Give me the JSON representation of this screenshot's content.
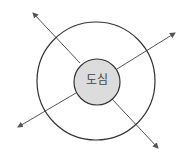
{
  "diagram": {
    "center_label": "도심",
    "colors": {
      "line": "#333333",
      "arrow": "#555555",
      "center_fill": "#dcdcdc",
      "background": "#ffffff"
    },
    "outer_circle": {
      "cx": 96,
      "cy": 81,
      "r": 59
    },
    "inner_circle": {
      "cx": 97,
      "cy": 82,
      "r": 23
    },
    "arrows": [
      {
        "direction": "upper-left",
        "x1": 80,
        "y1": 63,
        "x2": 33,
        "y2": 13
      },
      {
        "direction": "upper-right",
        "x1": 117,
        "y1": 69,
        "x2": 175,
        "y2": 33
      },
      {
        "direction": "lower-left",
        "x1": 76,
        "y1": 93,
        "x2": 18,
        "y2": 127
      },
      {
        "direction": "lower-right",
        "x1": 112,
        "y1": 99,
        "x2": 158,
        "y2": 148
      }
    ]
  }
}
